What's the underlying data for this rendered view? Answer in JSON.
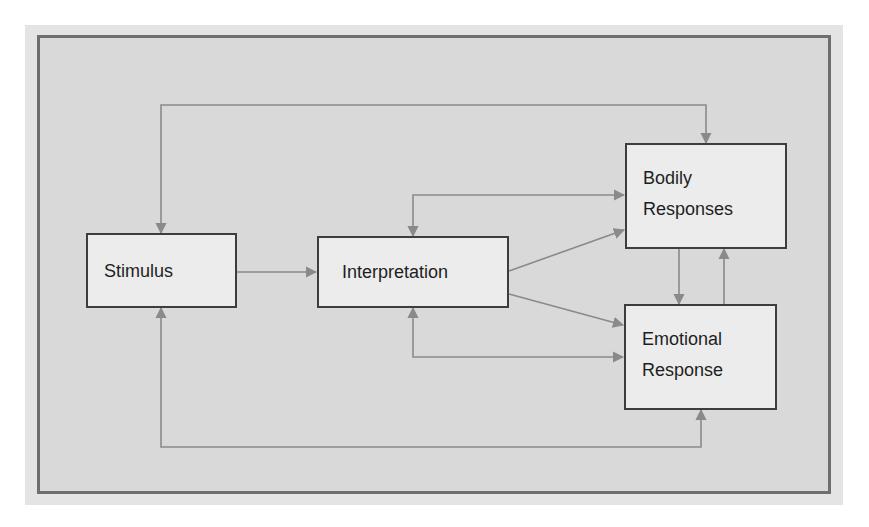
{
  "diagram": {
    "nodes": [
      {
        "id": "stimulus",
        "label": "Stimulus"
      },
      {
        "id": "interpretation",
        "label": "Interpretation"
      },
      {
        "id": "bodily",
        "lines": [
          "Bodily",
          "Responses"
        ]
      },
      {
        "id": "emotional",
        "lines": [
          "Emotional",
          "Response"
        ]
      }
    ],
    "edges": [
      {
        "from": "Stimulus",
        "to": "Interpretation",
        "type": "directed"
      },
      {
        "from": "Interpretation",
        "to": "Bodily Responses",
        "type": "directed"
      },
      {
        "from": "Interpretation",
        "to": "Emotional Response",
        "type": "directed"
      },
      {
        "from": "Bodily Responses",
        "to": "Emotional Response",
        "type": "directed"
      },
      {
        "from": "Emotional Response",
        "to": "Bodily Responses",
        "type": "directed"
      },
      {
        "from": "Stimulus",
        "to": "Bodily Responses",
        "type": "bidirectional",
        "route": "top loop"
      },
      {
        "from": "Interpretation",
        "to": "Bodily Responses",
        "type": "bidirectional",
        "route": "upper loop"
      },
      {
        "from": "Interpretation",
        "to": "Emotional Response",
        "type": "bidirectional",
        "route": "lower loop"
      },
      {
        "from": "Stimulus",
        "to": "Emotional Response",
        "type": "bidirectional",
        "route": "bottom loop"
      }
    ],
    "colors": {
      "background": "#d9d9d9",
      "frame_border": "#6e6e6e",
      "node_fill": "#ececec",
      "node_border": "#3d3d3d",
      "connector": "#8a8a8a",
      "text": "#1e1e1e"
    }
  }
}
